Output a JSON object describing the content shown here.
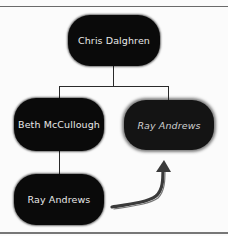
{
  "diagram": {
    "type": "org-chart",
    "nodes": {
      "root": {
        "label": "Chris Dalghren"
      },
      "left": {
        "label": "Beth McCullough"
      },
      "right_target": {
        "label": "Ray Andrews",
        "style": "ghost-italic"
      },
      "bottom": {
        "label": "Ray Andrews"
      }
    },
    "edges": [
      {
        "from": "Chris Dalghren",
        "to": "Beth McCullough"
      },
      {
        "from": "Chris Dalghren",
        "to": "Ray Andrews (target)"
      },
      {
        "from": "Beth McCullough",
        "to": "Ray Andrews"
      }
    ],
    "annotation": {
      "type": "hand-drawn-arrow",
      "meaning": "move Ray Andrews up to report to Chris Dalghren"
    },
    "colors": {
      "node_fill": "#0a0a0a",
      "node_text": "#e8e8e8",
      "connector": "#2a2a2a",
      "arrow": "#555555"
    }
  }
}
